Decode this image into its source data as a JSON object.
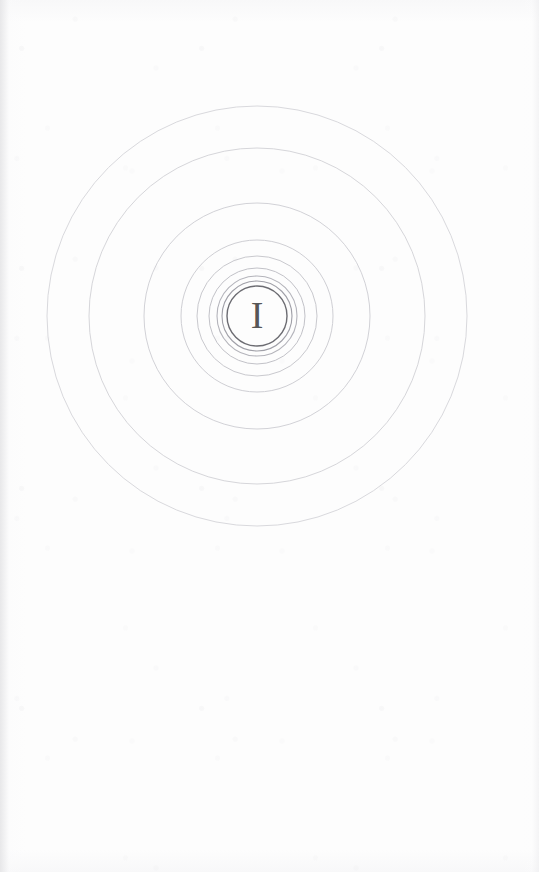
{
  "page": {
    "kind": "book-chapter-opening-page",
    "width": 539,
    "height": 872,
    "background_color": "#fdfdfd"
  },
  "ornament": {
    "name": "concentric-rings-chapter-ornament",
    "center_x": 257,
    "center_y": 316,
    "rings": [
      {
        "radius": 210,
        "stroke": "#d9d9dd",
        "width": 1.0
      },
      {
        "radius": 168,
        "stroke": "#d6d6da",
        "width": 1.0
      },
      {
        "radius": 113,
        "stroke": "#d2d2d7",
        "width": 1.0
      },
      {
        "radius": 76,
        "stroke": "#cfcfd4",
        "width": 1.0
      },
      {
        "radius": 60,
        "stroke": "#c9c9ce",
        "width": 1.0
      },
      {
        "radius": 48,
        "stroke": "#c2c2c8",
        "width": 1.0
      },
      {
        "radius": 40,
        "stroke": "#b4b4bb",
        "width": 1.1
      },
      {
        "radius": 35,
        "stroke": "#a0a0a8",
        "width": 1.1
      },
      {
        "radius": 30,
        "stroke": "#6c6c72",
        "width": 1.4
      }
    ]
  },
  "numeral": {
    "text": "I",
    "color": "#575757",
    "font_size_px": 38,
    "center_x": 257,
    "center_y": 316
  }
}
